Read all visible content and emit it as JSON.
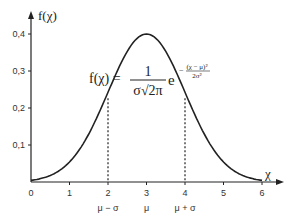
{
  "chart_data": {
    "type": "line",
    "title": "",
    "xlabel": "χ",
    "ylabel": "f(χ)",
    "xlim": [
      0,
      6
    ],
    "ylim": [
      0,
      0.4
    ],
    "x_ticks": [
      "0",
      "1",
      "2",
      "3",
      "4",
      "5",
      "6"
    ],
    "y_ticks": [
      "0,1",
      "0,2",
      "0,3",
      "0,4"
    ],
    "x_sublabels": [
      {
        "x": 2,
        "label": "μ − σ"
      },
      {
        "x": 3,
        "label": "μ"
      },
      {
        "x": 4,
        "label": "μ + σ"
      }
    ],
    "series": [
      {
        "name": "normal density",
        "mu": 3,
        "sigma": 1,
        "peak": 0.4,
        "x": [
          0,
          0.5,
          1,
          1.5,
          2,
          2.5,
          3,
          3.5,
          4,
          4.5,
          5,
          5.5,
          6
        ],
        "values": [
          0.004,
          0.018,
          0.054,
          0.13,
          0.242,
          0.352,
          0.4,
          0.352,
          0.242,
          0.13,
          0.054,
          0.018,
          0.004
        ]
      }
    ],
    "annotations": [
      {
        "type": "dashed-vline",
        "x": 2
      },
      {
        "type": "dashed-vline",
        "x": 4
      }
    ],
    "formula": {
      "lhs": "f(χ) =",
      "numerator": "1",
      "denominator": "σ√2π",
      "base": "e",
      "exp_numerator": "(χ − μ)²",
      "exp_denominator": "2σ²",
      "exp_sign": "−"
    },
    "grid": false,
    "legend": null
  }
}
